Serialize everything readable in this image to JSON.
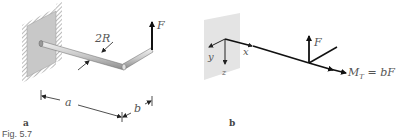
{
  "figure": {
    "caption": "Fig. 5.7",
    "panel_a": {
      "label": "a",
      "force_label": "F",
      "diameter_label": "2R",
      "length_a_label": "a",
      "length_b_label": "b"
    },
    "panel_b": {
      "label": "b",
      "force_label": "F",
      "axis_x_label": "x",
      "axis_y_label": "y",
      "axis_z_label": "z",
      "moment_label_main": "M",
      "moment_label_sub": "T",
      "moment_label_rest": " = bF"
    },
    "colors": {
      "wall": "#c8c8c8",
      "wall_light": "#e6e6e6",
      "rod": "#cfcfcf",
      "line": "#111111",
      "text": "#555555"
    }
  }
}
